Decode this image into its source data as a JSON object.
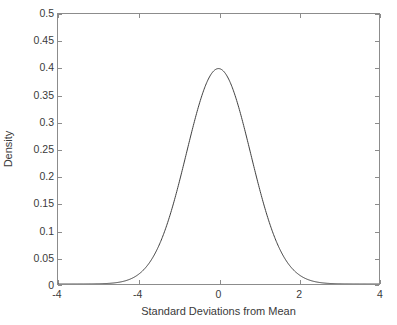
{
  "chart_data": {
    "type": "line",
    "title": "",
    "subtitle": "",
    "xlabel": "Standard Deviations from Mean",
    "ylabel": "Density",
    "xlim": [
      -5,
      5
    ],
    "ylim": [
      0,
      0.5
    ],
    "grid": false,
    "legend": null,
    "legend_position": "none",
    "annotations": [],
    "xticks": [
      -5,
      -2.5,
      0,
      2.5,
      5
    ],
    "xticklabels": [
      "-4",
      "-4",
      "0",
      "2",
      "4"
    ],
    "yticks": [
      0,
      0.05,
      0.1,
      0.15,
      0.2,
      0.25,
      0.3,
      0.35,
      0.4,
      0.45,
      0.5
    ],
    "yticklabels": [
      "0",
      "0.05",
      "0.1",
      "0.15",
      "0.2",
      "0.25",
      "0.3",
      "0.35",
      "0.4",
      "0.45",
      "0.5"
    ],
    "series": [
      {
        "name": "Standard Normal Density",
        "distribution": "normal",
        "mean": 0,
        "sd": 1,
        "peak_value": 0.3989,
        "peak_x": 0,
        "x": [
          -5,
          -4.75,
          -4.5,
          -4.25,
          -4,
          -3.75,
          -3.5,
          -3.25,
          -3,
          -2.75,
          -2.5,
          -2.25,
          -2,
          -1.75,
          -1.5,
          -1.25,
          -1,
          -0.75,
          -0.5,
          -0.25,
          0,
          0.25,
          0.5,
          0.75,
          1,
          1.25,
          1.5,
          1.75,
          2,
          2.25,
          2.5,
          2.75,
          3,
          3.25,
          3.5,
          3.75,
          4,
          4.25,
          4.5,
          4.75,
          5
        ],
        "values": [
          1.5e-06,
          5e-06,
          1.6e-05,
          4.65e-05,
          0.0001338,
          0.0003525,
          0.0008727,
          0.002031,
          0.0044318,
          0.0090936,
          0.0175283,
          0.0317017,
          0.053991,
          0.0862773,
          0.1295176,
          0.1826491,
          0.2419707,
          0.3011374,
          0.3520653,
          0.3866681,
          0.3989423,
          0.3866681,
          0.3520653,
          0.3011374,
          0.2419707,
          0.1826491,
          0.1295176,
          0.0862773,
          0.053991,
          0.0317017,
          0.0175283,
          0.0090936,
          0.0044318,
          0.002031,
          0.0008727,
          0.0003525,
          0.0001338,
          4.65e-05,
          1.6e-05,
          5e-06,
          1.5e-06
        ]
      }
    ]
  },
  "style": {
    "background_color": "#ffffff",
    "axis_color": "#8c8c8c",
    "curve_color": "#3f3f3f",
    "text_color": "#3a3a3a"
  }
}
